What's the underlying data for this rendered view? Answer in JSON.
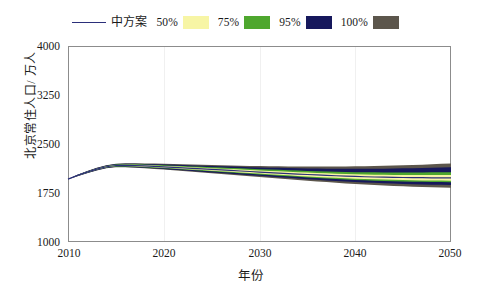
{
  "chart_data": {
    "type": "line",
    "title": "",
    "xlabel": "年份",
    "ylabel": "北京常住人口/ 万人",
    "xlim": [
      2010,
      2050
    ],
    "ylim": [
      1000,
      4000
    ],
    "xticks": [
      "2010",
      "2020",
      "2030",
      "2040",
      "2050"
    ],
    "yticks": [
      "1000",
      "1750",
      "2500",
      "3250",
      "4000"
    ],
    "grid": "vertical-faint",
    "legend_position": "top-center",
    "x": [
      2010,
      2011,
      2012,
      2013,
      2014,
      2015,
      2016,
      2017,
      2018,
      2019,
      2020,
      2021,
      2022,
      2023,
      2024,
      2025,
      2026,
      2027,
      2028,
      2029,
      2030,
      2031,
      2032,
      2033,
      2034,
      2035,
      2036,
      2037,
      2038,
      2039,
      2040,
      2041,
      2042,
      2043,
      2044,
      2045,
      2046,
      2047,
      2048,
      2049,
      2050
    ],
    "series": [
      {
        "name": "中方案",
        "kind": "line",
        "color": "#2b2f7a",
        "values": [
          1962,
          2019,
          2069,
          2115,
          2152,
          2171,
          2173,
          2171,
          2165,
          2158,
          2151,
          2143,
          2135,
          2127,
          2119,
          2111,
          2103,
          2095,
          2087,
          2079,
          2071,
          2063,
          2055,
          2047,
          2040,
          2033,
          2026,
          2020,
          2014,
          2008,
          2003,
          1999,
          1995,
          1992,
          1989,
          1987,
          1985,
          1984,
          1983,
          1982,
          1982
        ]
      },
      {
        "name": "50%",
        "kind": "band",
        "color": "#f7f5a5",
        "lower": [
          1962,
          2015,
          2063,
          2108,
          2144,
          2162,
          2163,
          2160,
          2153,
          2145,
          2137,
          2128,
          2119,
          2110,
          2101,
          2092,
          2083,
          2074,
          2065,
          2056,
          2047,
          2038,
          2029,
          2020,
          2012,
          2004,
          1996,
          1989,
          1982,
          1975,
          1969,
          1964,
          1959,
          1955,
          1951,
          1948,
          1945,
          1943,
          1941,
          1940,
          1939
        ],
        "upper": [
          1962,
          2023,
          2075,
          2122,
          2160,
          2180,
          2183,
          2182,
          2177,
          2171,
          2165,
          2158,
          2151,
          2144,
          2137,
          2130,
          2123,
          2116,
          2109,
          2102,
          2095,
          2088,
          2081,
          2074,
          2068,
          2062,
          2056,
          2051,
          2046,
          2041,
          2037,
          2034,
          2031,
          2029,
          2027,
          2026,
          2025,
          2025,
          2025,
          2024,
          2025
        ]
      },
      {
        "name": "75%",
        "kind": "band",
        "color": "#4ea72e",
        "lower": [
          1962,
          2013,
          2060,
          2104,
          2139,
          2157,
          2157,
          2154,
          2146,
          2138,
          2129,
          2120,
          2110,
          2101,
          2091,
          2082,
          2072,
          2063,
          2053,
          2044,
          2034,
          2025,
          2015,
          2006,
          1997,
          1988,
          1980,
          1972,
          1964,
          1957,
          1950,
          1945,
          1939,
          1935,
          1930,
          1927,
          1923,
          1921,
          1919,
          1917,
          1916
        ],
        "upper": [
          1962,
          2025,
          2078,
          2126,
          2165,
          2186,
          2189,
          2189,
          2185,
          2180,
          2175,
          2169,
          2163,
          2157,
          2151,
          2145,
          2139,
          2133,
          2127,
          2121,
          2115,
          2109,
          2104,
          2098,
          2093,
          2088,
          2084,
          2080,
          2076,
          2072,
          2069,
          2067,
          2066,
          2065,
          2064,
          2064,
          2064,
          2065,
          2066,
          2067,
          2069
        ]
      },
      {
        "name": "95%",
        "kind": "band",
        "color": "#16185c",
        "lower": [
          1962,
          2010,
          2056,
          2099,
          2133,
          2150,
          2149,
          2145,
          2136,
          2127,
          2117,
          2107,
          2097,
          2086,
          2076,
          2065,
          2055,
          2044,
          2034,
          2023,
          2013,
          2002,
          1992,
          1982,
          1971,
          1962,
          1952,
          1943,
          1934,
          1926,
          1918,
          1911,
          1905,
          1899,
          1894,
          1889,
          1885,
          1881,
          1878,
          1875,
          1873
        ],
        "upper": [
          1962,
          2028,
          2082,
          2131,
          2171,
          2193,
          2197,
          2197,
          2195,
          2191,
          2187,
          2182,
          2177,
          2172,
          2167,
          2163,
          2158,
          2154,
          2150,
          2146,
          2142,
          2138,
          2135,
          2131,
          2128,
          2126,
          2124,
          2122,
          2121,
          2120,
          2120,
          2120,
          2121,
          2123,
          2125,
          2127,
          2130,
          2133,
          2137,
          2141,
          2146
        ]
      },
      {
        "name": "100%",
        "kind": "band",
        "color": "#5c564c",
        "lower": [
          1962,
          2008,
          2053,
          2095,
          2128,
          2144,
          2143,
          2138,
          2128,
          2118,
          2108,
          2097,
          2086,
          2075,
          2063,
          2052,
          2040,
          2029,
          2017,
          2006,
          1994,
          1983,
          1971,
          1960,
          1949,
          1938,
          1927,
          1917,
          1907,
          1897,
          1888,
          1880,
          1872,
          1865,
          1858,
          1852,
          1847,
          1842,
          1838,
          1834,
          1831
        ],
        "upper": [
          1962,
          2030,
          2085,
          2135,
          2176,
          2199,
          2204,
          2205,
          2203,
          2200,
          2197,
          2193,
          2189,
          2185,
          2181,
          2178,
          2174,
          2171,
          2168,
          2165,
          2163,
          2161,
          2159,
          2157,
          2156,
          2155,
          2155,
          2155,
          2156,
          2157,
          2158,
          2160,
          2163,
          2166,
          2170,
          2174,
          2179,
          2184,
          2190,
          2196,
          2203
        ]
      }
    ]
  },
  "legend": {
    "entries": [
      {
        "label": "中方案",
        "style": "line",
        "color": "#2b2f7a"
      },
      {
        "label": "50%",
        "style": "swatch",
        "color": "#f7f5a5"
      },
      {
        "label": "75%",
        "style": "swatch",
        "color": "#4ea72e"
      },
      {
        "label": "95%",
        "style": "swatch",
        "color": "#16185c"
      },
      {
        "label": "100%",
        "style": "swatch",
        "color": "#5c564c"
      }
    ]
  },
  "axes": {
    "y_title": "北京常住人口/ 万人",
    "x_title": "年份",
    "y_ticks": [
      "4000",
      "3250",
      "2500",
      "1750",
      "1000"
    ],
    "x_ticks": [
      "2010",
      "2020",
      "2030",
      "2040",
      "2050"
    ]
  }
}
